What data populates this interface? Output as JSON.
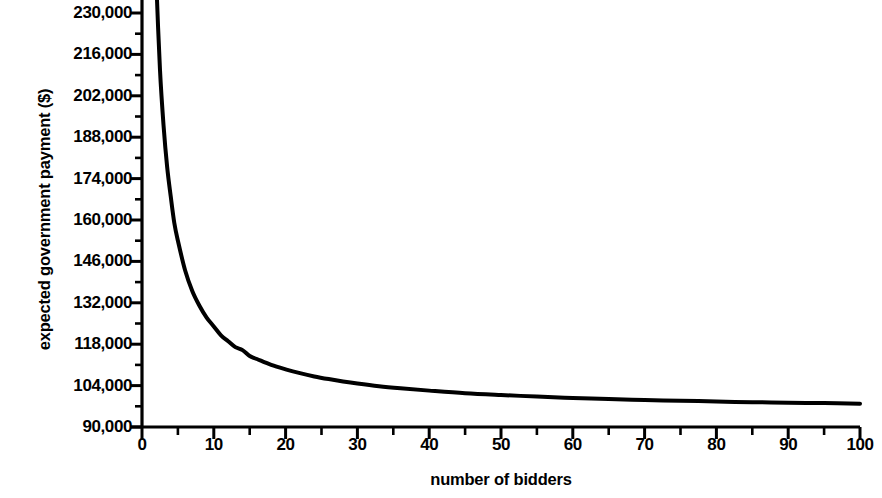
{
  "chart_data": {
    "type": "line",
    "title": "",
    "xlabel": "number of bidders",
    "ylabel": "expected government payment ($)",
    "xlim": [
      0,
      100
    ],
    "ylim": [
      90000,
      230000
    ],
    "grid": false,
    "legend": "none",
    "x_ticks": [
      0,
      10,
      20,
      30,
      40,
      50,
      60,
      70,
      80,
      90,
      100
    ],
    "x_tick_labels": [
      "0",
      "10",
      "20",
      "30",
      "40",
      "50",
      "60",
      "70",
      "80",
      "90",
      "100"
    ],
    "x_minor_ticks": [
      5,
      15,
      25,
      35,
      45,
      55,
      65,
      75,
      85,
      95
    ],
    "y_ticks": [
      90000,
      104000,
      118000,
      132000,
      146000,
      160000,
      174000,
      188000,
      202000,
      216000,
      230000
    ],
    "y_tick_labels": [
      "90,000",
      "104,000",
      "118,000",
      "132,000",
      "146,000",
      "160,000",
      "174,000",
      "188,000",
      "202,000",
      "216,000",
      "230,000"
    ],
    "y_minor_ticks": [
      97000,
      111000,
      125000,
      139000,
      153000,
      167000,
      181000,
      195000,
      209000,
      223000
    ],
    "line_color": "#000000",
    "line_width": 4,
    "series": [
      {
        "name": "expected government payment",
        "x": [
          1.4,
          1.6,
          1.8,
          2,
          2.5,
          3,
          3.5,
          4,
          4.5,
          5,
          6,
          7,
          8,
          9,
          10,
          11,
          12,
          13,
          14,
          15,
          16,
          18,
          20,
          22,
          24,
          26,
          28,
          30,
          33,
          36,
          40,
          45,
          50,
          55,
          60,
          65,
          70,
          75,
          80,
          85,
          90,
          95,
          100
        ],
        "values": [
          302000,
          276000,
          256000,
          240000,
          211000,
          192000,
          178000,
          168000,
          159000,
          153000,
          143000,
          136000,
          131000,
          127000,
          124000,
          121000,
          119000,
          117000,
          116000,
          114000,
          113000,
          111000,
          109500,
          108200,
          107100,
          106200,
          105400,
          104700,
          103800,
          103100,
          102300,
          101400,
          100800,
          100300,
          99800,
          99500,
          99100,
          98900,
          98600,
          98400,
          98200,
          98100,
          97900
        ]
      }
    ]
  },
  "axes": {
    "y_title": "expected government payment ($)",
    "x_title": "number of bidders"
  }
}
